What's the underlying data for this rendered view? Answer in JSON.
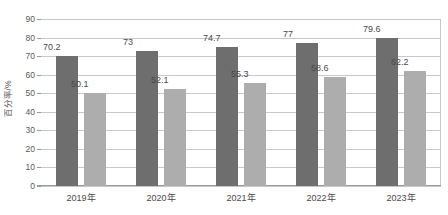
{
  "chart_data": {
    "type": "bar",
    "title": "",
    "subtitle": "",
    "xlabel": "",
    "ylabel": "百分率/%",
    "ylim": [
      0,
      90
    ],
    "ytick_step": 10,
    "ytick_labels": [
      "0",
      "10",
      "20",
      "30",
      "40",
      "50",
      "60",
      "70",
      "80",
      "90"
    ],
    "grid": true,
    "legend": "none",
    "categories": [
      "2019年",
      "2020年",
      "2021年",
      "2022年",
      "2023年"
    ],
    "series": [
      {
        "name": "series-a",
        "color": "#6e6e6e",
        "values": [
          70.2,
          73,
          74.7,
          77,
          79.6
        ],
        "labels": [
          "70.2",
          "73",
          "74.7",
          "77",
          "79.6"
        ]
      },
      {
        "name": "series-b",
        "color": "#adadad",
        "values": [
          50.1,
          52.1,
          55.3,
          58.6,
          62.2
        ],
        "labels": [
          "50.1",
          "52.1",
          "55.3",
          "58.6",
          "62.2"
        ]
      }
    ]
  },
  "style": {
    "background": "#ffffff",
    "gridline_color": "#c8c8c8",
    "axis_color": "#9a9a9a",
    "text_color": "#4a4a4a"
  }
}
